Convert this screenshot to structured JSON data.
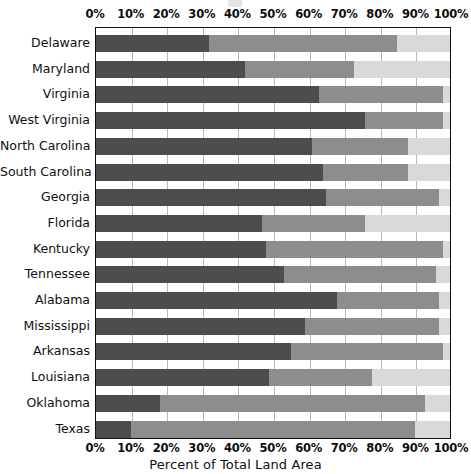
{
  "chart_data": {
    "type": "bar",
    "orientation": "horizontal",
    "stacked": true,
    "normalized_percent": true,
    "title": "",
    "xlabel": "Percent of Total Land Area",
    "ylabel": "",
    "xlim": [
      0,
      100
    ],
    "xticks": [
      0,
      10,
      20,
      30,
      40,
      50,
      60,
      70,
      80,
      90,
      100
    ],
    "xtick_labels": [
      "0%",
      "10%",
      "20%",
      "30%",
      "40%",
      "50%",
      "60%",
      "70%",
      "80%",
      "90%",
      "100%"
    ],
    "grid": true,
    "grid_axis": "x",
    "legend": null,
    "legend_position": "none",
    "categories": [
      "Delaware",
      "Maryland",
      "Virginia",
      "West Virginia",
      "North Carolina",
      "South Carolina",
      "Georgia",
      "Florida",
      "Kentucky",
      "Tennessee",
      "Alabama",
      "Mississippi",
      "Arkansas",
      "Louisiana",
      "Oklahoma",
      "Texas"
    ],
    "series": [
      {
        "name": "segment-1",
        "color": "#4d4d4d",
        "values": [
          32,
          42,
          63,
          76,
          61,
          64,
          65,
          47,
          48,
          53,
          68,
          59,
          55,
          49,
          18,
          10
        ]
      },
      {
        "name": "segment-2",
        "color": "#8d8d8d",
        "values": [
          53,
          31,
          35,
          22,
          27,
          24,
          32,
          29,
          50,
          43,
          29,
          38,
          43,
          29,
          75,
          80
        ]
      },
      {
        "name": "segment-3",
        "color": "#d9d9d9",
        "values": [
          15,
          27,
          2,
          2,
          12,
          12,
          3,
          24,
          2,
          4,
          3,
          3,
          2,
          22,
          7,
          10
        ]
      }
    ],
    "cumulative_boundaries": [
      [
        32,
        85
      ],
      [
        42,
        73
      ],
      [
        63,
        98
      ],
      [
        76,
        98
      ],
      [
        61,
        88
      ],
      [
        64,
        88
      ],
      [
        65,
        97
      ],
      [
        47,
        76
      ],
      [
        48,
        98
      ],
      [
        53,
        96
      ],
      [
        68,
        97
      ],
      [
        59,
        97
      ],
      [
        55,
        98
      ],
      [
        49,
        78
      ],
      [
        18,
        93
      ],
      [
        10,
        90
      ]
    ]
  },
  "colors": {
    "segment_dark": "#4d4d4d",
    "segment_mid": "#8d8d8d",
    "segment_light": "#d9d9d9",
    "gridline": "#b8b8b8",
    "frame": "#111111",
    "background": "#ffffff",
    "text": "#101010"
  }
}
